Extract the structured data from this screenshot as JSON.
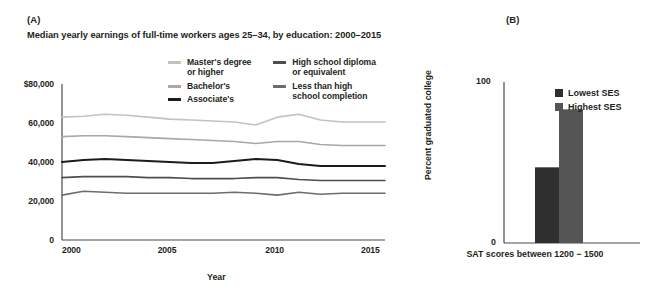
{
  "panels": {
    "a_label": "(A)",
    "b_label": "(B)"
  },
  "colors": {
    "masters": "#c2c2c2",
    "bachelors": "#a8a8a8",
    "associates": "#1c1c1c",
    "hs_diploma": "#4e4e4e",
    "less_than_hs": "#6d6d6d",
    "lowest_ses": "#2f2f2f",
    "highest_ses": "#555555",
    "axis": "#4a4a4a",
    "text": "#231f20"
  },
  "chart_data": [
    {
      "type": "line",
      "panel": "(A)",
      "title": "Median yearly earnings of full-time workers ages 25–34, by education: 2000–2015",
      "xlabel": "Year",
      "ylabel": "",
      "xlim": [
        2000,
        2015
      ],
      "ylim": [
        0,
        80000
      ],
      "grid": false,
      "legend_position": "top-center",
      "xticks": [
        "2000",
        "2005",
        "2010",
        "2015"
      ],
      "xtick_values": [
        2000,
        2005,
        2010,
        2015
      ],
      "yticks": [
        "$80,000",
        "60,000",
        "40,000",
        "20,000",
        "0"
      ],
      "ytick_values": [
        80000,
        60000,
        40000,
        20000,
        0
      ],
      "x": [
        2000,
        2001,
        2002,
        2003,
        2004,
        2005,
        2006,
        2007,
        2008,
        2009,
        2010,
        2011,
        2012,
        2013,
        2014,
        2015
      ],
      "series": [
        {
          "name": "Master's degree or higher",
          "color": "#c2c2c2",
          "values": [
            63000,
            63500,
            64500,
            64000,
            63000,
            62000,
            61500,
            61000,
            60500,
            59000,
            63000,
            64500,
            61500,
            60500,
            60500,
            60500
          ]
        },
        {
          "name": "Bachelor's",
          "color": "#a8a8a8",
          "values": [
            53000,
            53500,
            53500,
            53000,
            52500,
            52000,
            51500,
            51000,
            50500,
            49500,
            50500,
            50500,
            49000,
            48500,
            48500,
            48500
          ]
        },
        {
          "name": "Associate's",
          "color": "#1c1c1c",
          "values": [
            40000,
            41000,
            41500,
            41000,
            40500,
            40000,
            39500,
            39500,
            40500,
            41500,
            41000,
            39000,
            38000,
            38000,
            38000,
            38000
          ]
        },
        {
          "name": "High school diploma or equivalent",
          "color": "#4e4e4e",
          "values": [
            32000,
            32500,
            32500,
            32500,
            32000,
            32000,
            31500,
            31500,
            31500,
            32000,
            32000,
            31000,
            30500,
            30500,
            30500,
            30500
          ]
        },
        {
          "name": "Less than high school completion",
          "color": "#6d6d6d",
          "values": [
            23000,
            25000,
            24500,
            24000,
            24000,
            24000,
            24000,
            24000,
            24500,
            24000,
            23000,
            24500,
            23500,
            24000,
            24000,
            24000
          ]
        }
      ],
      "legend": [
        {
          "label": "Master's degree\nor higher",
          "color": "#c2c2c2"
        },
        {
          "label": "Bachelor's",
          "color": "#a8a8a8"
        },
        {
          "label": "Associate's",
          "color": "#1c1c1c"
        },
        {
          "label": "High school diploma\nor equivalent",
          "color": "#4e4e4e"
        },
        {
          "label": "Less than high\nschool completion",
          "color": "#6d6d6d"
        }
      ]
    },
    {
      "type": "bar",
      "panel": "(B)",
      "title": "",
      "xlabel": "SAT scores between\n1200 − 1500",
      "ylabel": "Percent graduated college",
      "ylim": [
        0,
        100
      ],
      "yticks": [
        "100",
        "0"
      ],
      "ytick_values": [
        100,
        0
      ],
      "grid": false,
      "legend_position": "top-right",
      "categories": [
        "SAT scores between 1200 − 1500"
      ],
      "series": [
        {
          "name": "Lowest SES",
          "color": "#2f2f2f",
          "values": [
            47
          ]
        },
        {
          "name": "Highest SES",
          "color": "#555555",
          "values": [
            83
          ]
        }
      ],
      "legend": [
        {
          "label": "Lowest SES",
          "color": "#2f2f2f"
        },
        {
          "label": "Highest SES",
          "color": "#555555"
        }
      ]
    }
  ]
}
